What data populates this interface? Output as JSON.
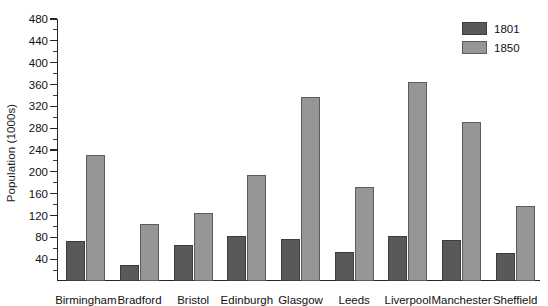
{
  "chart_data": {
    "type": "bar",
    "title": "",
    "xlabel": "",
    "ylabel": "Population (1000s)",
    "ylim": [
      0,
      480
    ],
    "ytick_step": 40,
    "yticks": [
      40,
      80,
      120,
      160,
      200,
      240,
      280,
      320,
      360,
      400,
      440,
      480
    ],
    "ytick_labels": [
      "40",
      "80",
      "120",
      "160",
      "200",
      "240",
      "280",
      "320",
      "360",
      "400",
      "440",
      "480"
    ],
    "minor_ticks": true,
    "grid": false,
    "legend_position": "top-right",
    "categories": [
      "Birmingham",
      "Bradford",
      "Bristol",
      "Edinburgh",
      "Glasgow",
      "Leeds",
      "Liverpool",
      "Manchester",
      "Sheffield"
    ],
    "series": [
      {
        "name": "1801",
        "color": "#595959",
        "values": [
          74,
          30,
          66,
          83,
          77,
          53,
          82,
          75,
          51
        ]
      },
      {
        "name": "1850",
        "color": "#969696",
        "values": [
          230,
          104,
          125,
          194,
          338,
          172,
          364,
          292,
          138
        ]
      }
    ]
  },
  "legend": {
    "items": [
      {
        "label": "1801",
        "series": "s1801"
      },
      {
        "label": "1850",
        "series": "s1850"
      }
    ]
  }
}
